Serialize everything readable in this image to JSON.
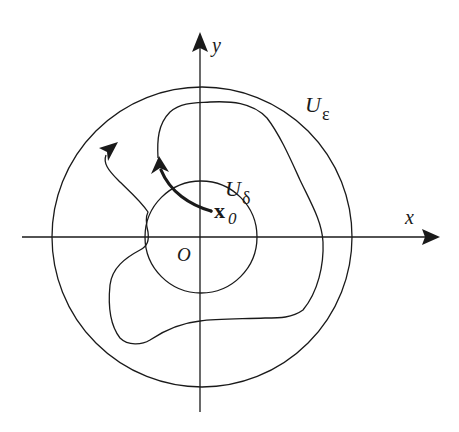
{
  "figure": {
    "type": "phase-portrait-stability-diagram",
    "colors": {
      "ink": "#1a1a1a",
      "background": "#ffffff"
    },
    "axes": {
      "x_label": "x",
      "y_label": "y",
      "origin_label": "O"
    },
    "regions": [
      {
        "id": "outer",
        "label_main": "U",
        "label_sub": "ε",
        "description": "ε-neighborhood circle"
      },
      {
        "id": "inner",
        "label_main": "U",
        "label_sub": "δ",
        "description": "δ-neighborhood circle"
      }
    ],
    "point": {
      "label_main": "x",
      "label_sub": "0"
    },
    "trajectories": [
      {
        "id": "bounded",
        "description": "trajectory from x0 staying inside U_ε"
      },
      {
        "id": "escaping",
        "description": "trajectory leaving toward upper-left"
      }
    ]
  }
}
